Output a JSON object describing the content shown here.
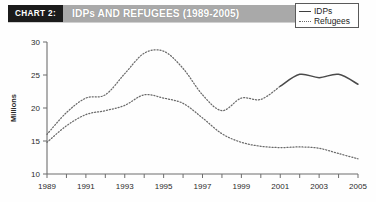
{
  "header": {
    "chart_tag": "CHART 2:",
    "title": "IDPs AND REFUGEES (1989-2005)"
  },
  "legend": {
    "position": "top-right",
    "items": [
      {
        "label": "IDPs",
        "style": "solid",
        "color": "#4a4a4a"
      },
      {
        "label": "Refugees",
        "style": "dotted",
        "color": "#6a6a6a"
      }
    ]
  },
  "axes": {
    "y_title": "Millions",
    "y_ticks": [
      "10",
      "15",
      "20",
      "25",
      "30"
    ],
    "x_ticks": [
      "1989",
      "1991",
      "1993",
      "1995",
      "1997",
      "1999",
      "2001",
      "2003",
      "2005"
    ]
  },
  "chart_data": {
    "type": "line",
    "title": "IDPs AND REFUGEES (1989-2005)",
    "xlabel": "",
    "ylabel": "Millions",
    "xlim": [
      1989,
      2005
    ],
    "ylim": [
      10,
      30
    ],
    "grid": false,
    "legend_position": "top-right",
    "x": [
      1989,
      1990,
      1991,
      1992,
      1993,
      1994,
      1995,
      1996,
      1997,
      1998,
      1999,
      2000,
      2001,
      2002,
      2003,
      2004,
      2005
    ],
    "series": [
      {
        "name": "IDPs",
        "style": "dotted-then-solid",
        "solid_from": 2001,
        "values": [
          16.0,
          19.3,
          21.5,
          22.0,
          25.2,
          28.3,
          28.6,
          26.0,
          22.0,
          19.6,
          21.5,
          21.3,
          23.3,
          25.1,
          24.6,
          25.1,
          23.6
        ]
      },
      {
        "name": "Refugees",
        "style": "dotted",
        "values": [
          14.8,
          17.3,
          19.0,
          19.6,
          20.4,
          22.0,
          21.5,
          20.7,
          18.5,
          16.1,
          14.8,
          14.2,
          14.0,
          14.1,
          13.9,
          13.1,
          12.3
        ]
      }
    ]
  }
}
